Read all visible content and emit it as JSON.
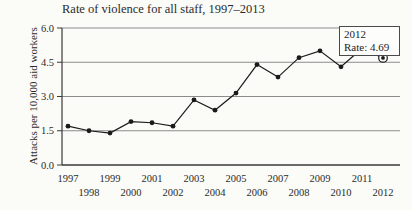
{
  "colors": {
    "background": "#fbfbf7",
    "line": "#1a1a1a",
    "marker": "#1a1a1a",
    "grid": "#8c8c8c",
    "axis": "#3a3a3a",
    "text": "#2b2b2b"
  },
  "chart_data": {
    "type": "line",
    "title": "Rate of violence for all staff, 1997–2013",
    "ylabel": "Attacks per 10,000 aid workers",
    "xlabel": "",
    "x": [
      1997,
      1998,
      1999,
      2000,
      2001,
      2002,
      2003,
      2004,
      2005,
      2006,
      2007,
      2008,
      2009,
      2010,
      2011,
      2012
    ],
    "values": [
      1.7,
      1.5,
      1.4,
      1.9,
      1.85,
      1.7,
      2.85,
      2.4,
      3.15,
      4.4,
      3.85,
      4.7,
      5.0,
      4.3,
      5.1,
      4.69
    ],
    "ylim": [
      0.0,
      6.0
    ],
    "yticks": [
      0.0,
      1.5,
      3.0,
      4.5,
      6.0
    ],
    "ytick_labels": [
      "0.0",
      "1.5",
      "3.0",
      "4.5",
      "6.0"
    ],
    "xtick_labels": [
      "1997",
      "1998",
      "1999",
      "2000",
      "2001",
      "2002",
      "2003",
      "2004",
      "2005",
      "2006",
      "2007",
      "2008",
      "2009",
      "2010",
      "2011",
      "2012"
    ],
    "grid": "horizontal",
    "legend": "none",
    "annotation": {
      "line1": "2012",
      "line2": "Rate: 4.69",
      "year": "2012",
      "value": "4.69"
    },
    "highlight": {
      "year": "2012",
      "marker": "circled-dot"
    }
  }
}
